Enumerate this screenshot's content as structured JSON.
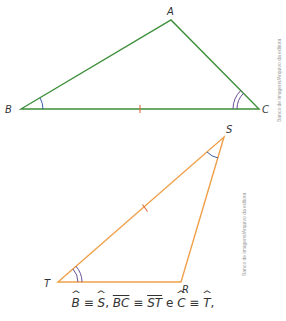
{
  "figure1": {
    "triangle": "ABC",
    "vertices": {
      "A": {
        "label": "A",
        "x": 171,
        "y": 20
      },
      "B": {
        "label": "B",
        "x": 21,
        "y": 109
      },
      "C": {
        "label": "C",
        "x": 259,
        "y": 109
      }
    },
    "stroke_color": "#3c8f3a",
    "credit": "Banco de imagens/Arquivo da editora"
  },
  "figure2": {
    "triangle": "TSR",
    "vertices": {
      "S": {
        "label": "S",
        "x": 224,
        "y": 137
      },
      "T": {
        "label": "T",
        "x": 58,
        "y": 282
      },
      "R": {
        "label": "R",
        "x": 181,
        "y": 282
      }
    },
    "stroke_color": "#f0a04a",
    "credit": "Banco de imagens/Arquivo da editora"
  },
  "angle_mark_colors": {
    "single": "#3d5fa8",
    "double": "#6a4f9a"
  },
  "caption": {
    "b": "B",
    "s1": "S",
    "bc": "BC",
    "st": "ST",
    "c": "C",
    "t": "T",
    "equiv": "≡",
    "comma": ",",
    "and": "e"
  }
}
